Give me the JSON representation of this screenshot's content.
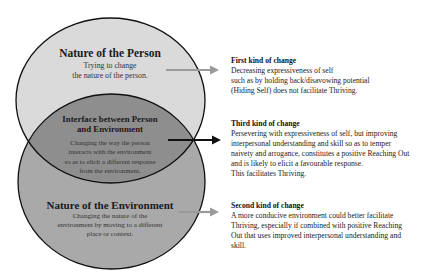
{
  "colors": {
    "person_fill": "#dadada",
    "interface_fill": "#8e8e8e",
    "environment_fill": "#a9a9a9",
    "outline": "#111111",
    "grey_arrow": "#9a9a9a",
    "black_arrow": "#111111"
  },
  "circles": {
    "person": {
      "title": "Nature of the Person",
      "lines": [
        "Trying to change",
        "the nature of the person."
      ]
    },
    "interface": {
      "title_lines": [
        "Interface between Person",
        "and Environment"
      ],
      "lines": [
        "Changing the way the person",
        "interacts with the environment",
        "so as to elicit a different response",
        "from the environment."
      ]
    },
    "environment": {
      "title": "Nature of the Environment",
      "lines": [
        "Changing the nature of the",
        "environment by moving to a different",
        "place or context."
      ]
    }
  },
  "changes": [
    {
      "heading": "First kind of change",
      "lines": [
        "Decreasing expressiveness of self",
        "such as by holding back/disavowing potential",
        "(Hiding Self) does not facilitate Thriving."
      ]
    },
    {
      "heading": "Third kind of change",
      "lines": [
        "Persevering with expressiveness of self, but improving",
        "interpersonal understanding and skill so as to temper",
        "naivety and arrogance, constitutes a positive Reaching Out",
        "and is likely to elicit a favourable response.",
        "This facilitates Thriving."
      ]
    },
    {
      "heading": "Second kind of change",
      "lines": [
        "A more conducive environment could better facilitate",
        "Thriving, especially if combined with positive Reaching",
        "Out that uses improved interpersonal understanding and",
        "skill."
      ]
    }
  ]
}
